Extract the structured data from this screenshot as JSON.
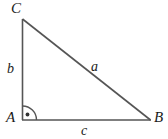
{
  "diagram": {
    "kind": "right-triangle",
    "stroke_color": "#555555",
    "label_color": "#1a1a1a",
    "background_color": "#ffffff",
    "vertices": [
      {
        "id": "A",
        "label": "A",
        "x": 22,
        "y": 120,
        "role": "right-angle-vertex"
      },
      {
        "id": "B",
        "label": "B",
        "x": 150,
        "y": 120,
        "role": "vertex"
      },
      {
        "id": "C",
        "label": "C",
        "x": 22,
        "y": 19,
        "role": "apex"
      }
    ],
    "sides": [
      {
        "id": "a",
        "label": "a",
        "from": "B",
        "to": "C",
        "role": "hypotenuse"
      },
      {
        "id": "b",
        "label": "b",
        "from": "A",
        "to": "C",
        "role": "vertical-leg"
      },
      {
        "id": "c",
        "label": "c",
        "from": "A",
        "to": "B",
        "role": "horizontal-leg"
      }
    ],
    "angle_marker": {
      "at": "A",
      "type": "right-angle-arc-with-dot",
      "degrees": 90,
      "radius": 14
    }
  }
}
